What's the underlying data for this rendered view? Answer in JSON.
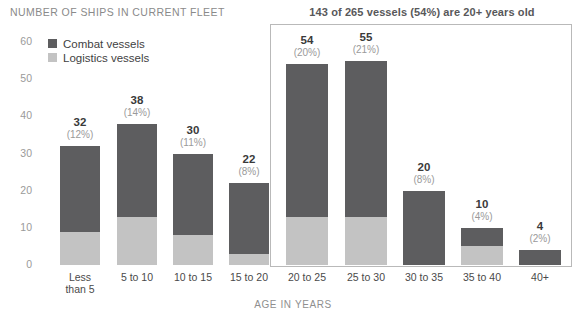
{
  "chart_data": {
    "type": "bar",
    "title": "NUMBER OF SHIPS IN CURRENT FLEET",
    "subtitle": "143 of 265 vessels (54%) are 20+ years old",
    "xlabel": "AGE IN YEARS",
    "ylabel": "",
    "ylim": [
      0,
      60
    ],
    "yticks": [
      60,
      50,
      40,
      30,
      20,
      10,
      0
    ],
    "grid": false,
    "legend_position": "top-left",
    "stacked": true,
    "categories": [
      "Less\nthan 5",
      "5 to 10",
      "10 to 15",
      "15 to 20",
      "20 to 25",
      "25 to 30",
      "30 to 35",
      "35 to 40",
      "40+"
    ],
    "series": [
      {
        "name": "Combat vessels",
        "color": "#5d5d5f",
        "values": [
          23,
          25,
          22,
          19,
          41,
          42,
          20,
          5,
          4
        ]
      },
      {
        "name": "Logistics vessels",
        "color": "#c3c3c3",
        "values": [
          9,
          13,
          8,
          3,
          13,
          13,
          0,
          5,
          0
        ]
      }
    ],
    "totals": [
      32,
      38,
      30,
      22,
      54,
      55,
      20,
      10,
      4
    ],
    "total_labels": [
      "32",
      "38",
      "30",
      "22",
      "54",
      "55",
      "20",
      "10",
      "4"
    ],
    "pct_labels": [
      "(12%)",
      "(14%)",
      "(11%)",
      "(8%)",
      "(20%)",
      "(21%)",
      "(8%)",
      "(4%)",
      "(2%)"
    ],
    "highlight": {
      "label": "143 of 265 vessels (54%) are 20+ years old",
      "from_category": "20 to 25",
      "to_category": "40+",
      "border_color": "#b9b9b9"
    }
  },
  "legend": {
    "items": [
      {
        "label": "Combat vessels",
        "color": "#5d5d5f",
        "key": "combat"
      },
      {
        "label": "Logistics vessels",
        "color": "#c3c3c3",
        "key": "logistics"
      }
    ]
  },
  "axis": {
    "y_ticks": [
      "60",
      "50",
      "40",
      "30",
      "20",
      "10",
      "0"
    ],
    "x_title": "AGE IN YEARS"
  },
  "colors": {
    "combat": "#5d5d5f",
    "logistics": "#c3c3c3",
    "title": "#8a8a8a",
    "highlight_border": "#b9b9b9",
    "background": "#ffffff"
  }
}
